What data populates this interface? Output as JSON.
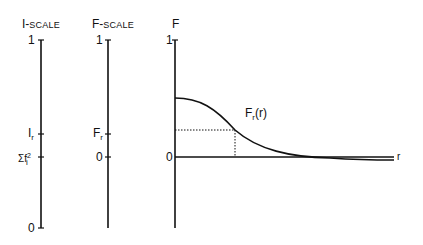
{
  "i_scale": {
    "title_main": "I-",
    "title_small": "SCALE",
    "tick_top": "1",
    "tick_ir_main": "I",
    "tick_ir_sub": "r",
    "tick_sum_main": "Σf",
    "tick_sum_sup": "2",
    "tick_sum_sub": "i",
    "tick_bottom": "0"
  },
  "f_scale": {
    "title_main": "F-",
    "title_small": "SCALE",
    "tick_top": "1",
    "tick_fr_main": "F",
    "tick_fr_sub": "r",
    "tick_zero": "0"
  },
  "f_plot": {
    "y_axis_label": "F",
    "tick_top": "1",
    "tick_zero": "0",
    "x_axis_label": "r",
    "curve_label_main": "F",
    "curve_label_sub": "r",
    "curve_label_arg": "(r)"
  },
  "colors": {
    "line": "#111111",
    "background": "#ffffff"
  }
}
